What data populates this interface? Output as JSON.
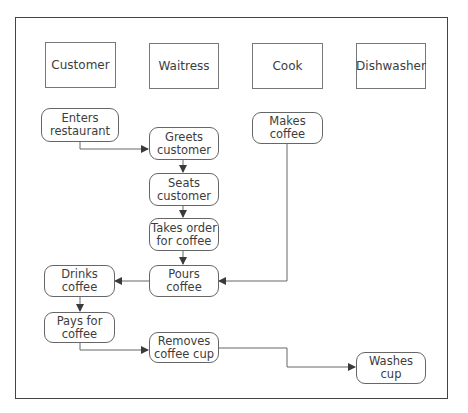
{
  "diagram": {
    "type": "swimlane-activity",
    "lanes": [
      {
        "id": "customer",
        "label": "Customer"
      },
      {
        "id": "waitress",
        "label": "Waitress"
      },
      {
        "id": "cook",
        "label": "Cook"
      },
      {
        "id": "dishwasher",
        "label": "Dishwasher"
      }
    ],
    "steps": {
      "enters_restaurant": {
        "line1": "Enters",
        "line2": "restaurant",
        "lane": "customer"
      },
      "greets_customer": {
        "line1": "Greets",
        "line2": "customer",
        "lane": "waitress"
      },
      "makes_coffee": {
        "line1": "Makes",
        "line2": "coffee",
        "lane": "cook"
      },
      "seats_customer": {
        "line1": "Seats",
        "line2": "customer",
        "lane": "waitress"
      },
      "takes_order": {
        "line1": "Takes order",
        "line2": "for coffee",
        "lane": "waitress"
      },
      "pours_coffee": {
        "line1": "Pours",
        "line2": "coffee",
        "lane": "waitress"
      },
      "drinks_coffee": {
        "line1": "Drinks",
        "line2": "coffee",
        "lane": "customer"
      },
      "pays_for_coffee": {
        "line1": "Pays for",
        "line2": "coffee",
        "lane": "customer"
      },
      "removes_cup": {
        "line1": "Removes",
        "line2": "coffee cup",
        "lane": "waitress"
      },
      "washes_cup": {
        "line1": "Washes cup",
        "line2": "",
        "lane": "dishwasher"
      }
    },
    "edges": [
      {
        "from": "Enters restaurant",
        "to": "Greets customer"
      },
      {
        "from": "Greets customer",
        "to": "Seats customer"
      },
      {
        "from": "Seats customer",
        "to": "Takes order for coffee"
      },
      {
        "from": "Takes order for coffee",
        "to": "Pours coffee"
      },
      {
        "from": "Makes coffee",
        "to": "Pours coffee"
      },
      {
        "from": "Pours coffee",
        "to": "Drinks coffee"
      },
      {
        "from": "Drinks coffee",
        "to": "Pays for coffee"
      },
      {
        "from": "Pays for coffee",
        "to": "Removes coffee cup"
      },
      {
        "from": "Removes coffee cup",
        "to": "Washes cup"
      }
    ],
    "colors": {
      "line": "#555555",
      "border": "#666666",
      "text": "#3d3d3d",
      "background": "#ffffff"
    }
  }
}
